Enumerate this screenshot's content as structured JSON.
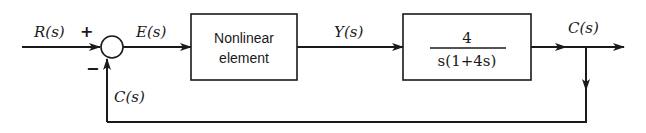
{
  "diagram": {
    "type": "feedback-block-diagram",
    "signals": {
      "input": "R(s)",
      "error": "E(s)",
      "intermediate": "Y(s)",
      "output": "C(s)",
      "feedback": "C(s)"
    },
    "summing_junction": {
      "plus_sign": "+",
      "minus_sign": "−"
    },
    "blocks": [
      {
        "id": "nonlinear",
        "line1": "Nonlinear",
        "line2": "element"
      },
      {
        "id": "plant",
        "numerator": "4",
        "denominator": "s(1+4s)"
      }
    ],
    "colors": {
      "stroke": "#1a1a1a",
      "background": "#ffffff"
    }
  }
}
